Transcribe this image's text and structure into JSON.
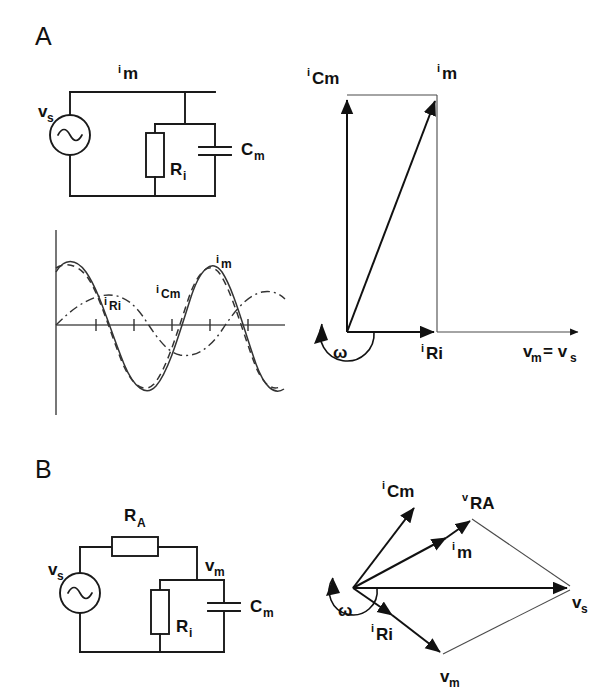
{
  "figure": {
    "background": "#ffffff",
    "ink": "#111111"
  },
  "panels": [
    {
      "id": "A",
      "letter": "A",
      "circuit": {
        "name": "parallel-RC-membrane-circuit",
        "source_label": "v",
        "source_sub": "s",
        "current_label": "i",
        "current_sub": "m",
        "resistor_label": "R",
        "resistor_sub": "i",
        "capacitor_label": "C",
        "capacitor_sub": "m"
      },
      "waveform": {
        "name": "current-waveforms-plot",
        "traces": [
          {
            "label": "i",
            "sub": "Ri",
            "style": "dash-dot",
            "amplitude": 0.42,
            "phase_deg": 0
          },
          {
            "label": "i",
            "sub": "Cm",
            "style": "dashed",
            "amplitude": 1.0,
            "phase_deg": 20
          },
          {
            "label": "i",
            "sub": "m",
            "style": "solid",
            "amplitude": 1.0,
            "phase_deg": 0
          }
        ],
        "has_vertical_axis": true,
        "has_horizontal_axis": true,
        "tick_count": 5
      },
      "phasor": {
        "name": "phasor-diagram-a",
        "omega_label": "ω",
        "vectors": [
          {
            "label": "i",
            "sub": "Cm",
            "angle_deg": 90,
            "length": 237
          },
          {
            "label": "i",
            "sub": "m",
            "angle_deg": 69,
            "length": 254
          },
          {
            "label": "i",
            "sub": "Ri",
            "angle_deg": 0,
            "length": 90
          }
        ],
        "axis_label_main": "v",
        "axis_label_main_sub": "m",
        "axis_label_eq": "= v",
        "axis_label_eq_sub": "s",
        "construction_lines": true
      }
    },
    {
      "id": "B",
      "letter": "B",
      "circuit": {
        "name": "series-RA-parallel-RC-circuit",
        "source_label": "v",
        "source_sub": "s",
        "series_resistor_label": "R",
        "series_resistor_sub": "A",
        "membrane_voltage_label": "v",
        "membrane_voltage_sub": "m",
        "resistor_label": "R",
        "resistor_sub": "i",
        "capacitor_label": "C",
        "capacitor_sub": "m"
      },
      "phasor": {
        "name": "phasor-diagram-b",
        "omega_label": "ω",
        "vectors": [
          {
            "label": "i",
            "sub": "Cm",
            "angle_deg": 67,
            "length": 102
          },
          {
            "label": "i",
            "sub": "m",
            "angle_deg": 36,
            "length": 117
          },
          {
            "label": "v",
            "sub": "RA",
            "angle_deg": 36,
            "length": 146,
            "tail": "im-tip"
          },
          {
            "label": "i",
            "sub": "Ri",
            "angle_deg": -33,
            "length": 48
          },
          {
            "label": "v",
            "sub": "m",
            "angle_deg": -33,
            "length": 105,
            "tail": "iRi-tip"
          },
          {
            "label": "v",
            "sub": "s",
            "angle_deg": 0,
            "length": 217
          }
        ],
        "closing_lines": true
      }
    }
  ]
}
